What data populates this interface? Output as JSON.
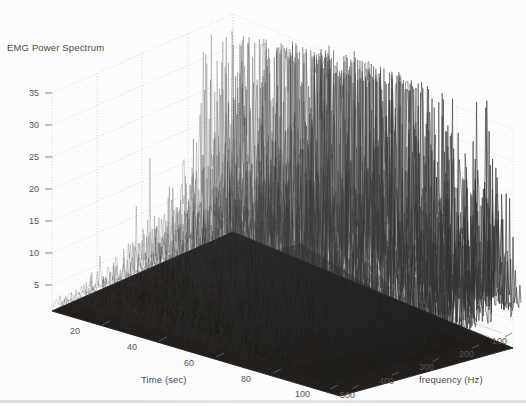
{
  "chart_data": {
    "type": "line",
    "render": "waterfall-3d-mesh",
    "title": "EMG Power Spectrum",
    "xlabel": "Time (sec)",
    "zlabel": "frequency (Hz)",
    "ylabel": "",
    "grid": true,
    "legend": null,
    "axes": {
      "time": {
        "label": "Time (sec)",
        "ticks": [
          20,
          40,
          60,
          80,
          100
        ],
        "tick_labels": [
          "20",
          "40",
          "60",
          "80",
          "100"
        ],
        "range": [
          0,
          110
        ],
        "units": "sec"
      },
      "frequency": {
        "label": "frequency (Hz)",
        "ticks": [
          500,
          400,
          300,
          200,
          100
        ],
        "tick_labels": [
          "500",
          "400",
          "300",
          "200",
          "100"
        ],
        "range": [
          0,
          500
        ],
        "units": "Hz",
        "direction": "descending-left-to-right"
      },
      "power": {
        "label": "",
        "ticks": [
          5,
          10,
          15,
          20,
          25,
          30,
          35
        ],
        "tick_labels": [
          "5",
          "10",
          "15",
          "20",
          "25",
          "30",
          "35"
        ],
        "range": [
          0,
          38
        ]
      }
    },
    "colors": {
      "background": "#fefefe",
      "surface_dark": "#231f1c",
      "mesh_line": "#3a3a3a",
      "grid": "#c9c9c9",
      "text": "#525252"
    },
    "peaks": [
      {
        "time": 46,
        "frequency": 65,
        "power": 38
      },
      {
        "time": 44,
        "frequency": 80,
        "power": 24
      },
      {
        "time": 52,
        "frequency": 70,
        "power": 22
      },
      {
        "time": 40,
        "frequency": 95,
        "power": 20
      },
      {
        "time": 58,
        "frequency": 120,
        "power": 17
      },
      {
        "time": 62,
        "frequency": 150,
        "power": 15
      },
      {
        "time": 70,
        "frequency": 200,
        "power": 13
      },
      {
        "time": 80,
        "frequency": 260,
        "power": 12
      },
      {
        "time": 88,
        "frequency": 330,
        "power": 11
      },
      {
        "time": 95,
        "frequency": 420,
        "power": 10
      }
    ],
    "series_count": 64,
    "points_per_series": 160
  }
}
